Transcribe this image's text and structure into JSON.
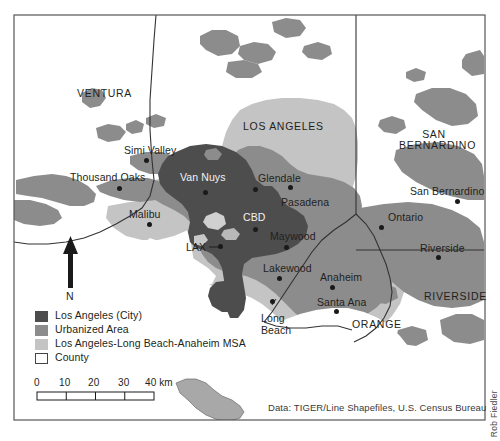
{
  "figure": {
    "credit_vertical": "Rob Fiedler",
    "data_source": "Data: TIGER/Line Shapefiles, U.S. Census Bureau"
  },
  "colors": {
    "city_of_la": "#4d4d4d",
    "urbanized_area": "#8c8c8c",
    "msa": "#c4c4c4",
    "county_fill": "#ffffff",
    "county_outline": "#333333",
    "frame": "#555555",
    "text": "#231f20",
    "background": "#ffffff"
  },
  "legend": {
    "items": [
      {
        "label": "Los Angeles (City)",
        "swatch": "city_of_la",
        "color": "#4d4d4d"
      },
      {
        "label": "Urbanized Area",
        "swatch": "urbanized_area",
        "color": "#8c8c8c"
      },
      {
        "label": "Los Angeles-Long Beach-Anaheim MSA",
        "swatch": "msa",
        "color": "#c4c4c4"
      },
      {
        "label": "County",
        "swatch": "county_fill",
        "color": "#ffffff"
      }
    ]
  },
  "north_arrow": {
    "label": "N"
  },
  "scale_bar": {
    "ticks": [
      "0",
      "10",
      "20",
      "30",
      "40"
    ],
    "unit": "km",
    "last_tick_label": "40 km"
  },
  "counties": [
    {
      "name": "VENTURA",
      "x": 77,
      "y": 88
    },
    {
      "name": "LOS ANGELES",
      "x": 243,
      "y": 121
    },
    {
      "name": "SAN BERNARDINO",
      "x": 410,
      "y": 136
    },
    {
      "name": "RIVERSIDE",
      "x": 432,
      "y": 297
    },
    {
      "name": "ORANGE",
      "x": 355,
      "y": 325
    }
  ],
  "cities": [
    {
      "name": "Simi Valley",
      "label_x": 124,
      "label_y": 145,
      "dot_x": 146,
      "dot_y": 160,
      "anchor": "left"
    },
    {
      "name": "Thousand Oaks",
      "label_x": 72,
      "label_y": 172,
      "dot_x": 118,
      "dot_y": 187,
      "anchor": "left"
    },
    {
      "name": "Van Nuys",
      "label_x": 180,
      "label_y": 172,
      "dot_x": 205,
      "dot_y": 192,
      "anchor": "left"
    },
    {
      "name": "Glendale",
      "label_x": 258,
      "label_y": 173,
      "dot_x": 255,
      "dot_y": 188,
      "anchor": "left"
    },
    {
      "name": "Pasadena",
      "label_x": 281,
      "label_y": 197,
      "dot_x": 290,
      "dot_y": 186,
      "anchor": "left"
    },
    {
      "name": "Malibu",
      "label_x": 130,
      "label_y": 209,
      "dot_x": 148,
      "dot_y": 223,
      "anchor": "left"
    },
    {
      "name": "CBD",
      "label_x": 244,
      "label_y": 214,
      "dot_x": 254,
      "dot_y": 229,
      "anchor": "left"
    },
    {
      "name": "Maywood",
      "label_x": 271,
      "label_y": 231,
      "dot_x": 286,
      "dot_y": 245,
      "anchor": "left"
    },
    {
      "name": "LAX",
      "label_x": 188,
      "label_y": 250,
      "dot_x": 217,
      "dot_y": 250,
      "anchor": "left"
    },
    {
      "name": "Lakewood",
      "label_x": 264,
      "label_y": 263,
      "dot_x": 278,
      "dot_y": 277,
      "anchor": "left"
    },
    {
      "name": "Anaheim",
      "label_x": 321,
      "label_y": 272,
      "dot_x": 331,
      "dot_y": 286,
      "anchor": "left"
    },
    {
      "name": "Santa Ana",
      "label_x": 318,
      "label_y": 298,
      "dot_x": 335,
      "dot_y": 310,
      "anchor": "left"
    },
    {
      "name": "Long Beach",
      "label_x": 263,
      "label_y": 313,
      "dot_x": 271,
      "dot_y": 301,
      "anchor": "left",
      "two_line": true,
      "line1": "Long",
      "line2": "Beach"
    },
    {
      "name": "San Bernardino",
      "label_x": 413,
      "label_y": 186,
      "dot_x": 457,
      "dot_y": 200,
      "anchor": "left"
    },
    {
      "name": "Ontario",
      "label_x": 389,
      "label_y": 212,
      "dot_x": 380,
      "dot_y": 226,
      "anchor": "left"
    },
    {
      "name": "Riverside",
      "label_x": 422,
      "label_y": 244,
      "dot_x": 437,
      "dot_y": 256,
      "anchor": "left"
    }
  ]
}
